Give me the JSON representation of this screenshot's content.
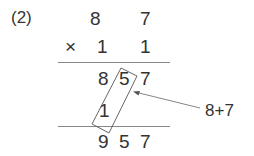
{
  "problem": {
    "number": "(2)",
    "multiplicand": [
      "8",
      "7"
    ],
    "operator": "×",
    "multiplier": [
      "1",
      "1"
    ],
    "partial_product_1": [
      "8",
      "5",
      "7"
    ],
    "carry_digit": "1",
    "result": [
      "9",
      "5",
      "7"
    ],
    "annotation": "8+7"
  },
  "colors": {
    "text": "#333333",
    "lines": "#888888"
  }
}
